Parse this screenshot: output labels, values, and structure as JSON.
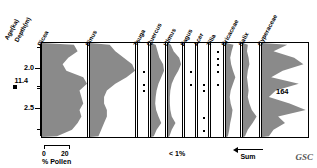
{
  "axis": {
    "title_age": "Age(ka)",
    "title_depth": "Depth(m)",
    "depth_ticks": [
      {
        "label": "2.0",
        "depth": 2.0
      },
      {
        "label": "2.5",
        "depth": 2.5
      }
    ],
    "minor_ticks": [
      1.75,
      2.25,
      2.75
    ],
    "age_markers": [
      {
        "label": "11.4",
        "depth": 2.22
      }
    ],
    "depth_range": [
      1.7,
      2.85
    ]
  },
  "legend": {
    "scale_min": "0",
    "scale_max": "20",
    "scale_caption": "% Pollen",
    "less_than_one": "< 1%",
    "sum_label": "Sum",
    "credit": "GSC",
    "count_label": "164"
  },
  "chart_data": {
    "type": "area",
    "xlabel": "% Pollen",
    "ylabel": "Depth(m)",
    "ylim": [
      1.7,
      2.85
    ],
    "xlim": [
      0,
      20
    ],
    "grid": false,
    "legend_position": "none",
    "depths": [
      1.72,
      1.8,
      1.88,
      1.96,
      2.04,
      2.12,
      2.2,
      2.28,
      2.36,
      2.44,
      2.52,
      2.6,
      2.68,
      2.76,
      2.84
    ],
    "series": [
      {
        "name": "Picea",
        "kind": "area",
        "width_px": 47,
        "max_pct": 24,
        "values": [
          17,
          19,
          14,
          11,
          13,
          22,
          24,
          20,
          21,
          22,
          20,
          21,
          19,
          16,
          8
        ]
      },
      {
        "name": "Pinus",
        "kind": "area",
        "width_px": 47,
        "max_pct": 16,
        "values": [
          7,
          9,
          12,
          15,
          16,
          13,
          9,
          6,
          5,
          5,
          6,
          6,
          5,
          4,
          3
        ]
      },
      {
        "name": "Tsuga",
        "kind": "dots",
        "width_px": 12,
        "max_pct": 1,
        "values": [
          0,
          0,
          0,
          0,
          0.4,
          0,
          0.4,
          0.4,
          0,
          0,
          0,
          0,
          0,
          0,
          0
        ]
      },
      {
        "name": "Quercus",
        "kind": "area",
        "width_px": 16,
        "max_pct": 3,
        "values": [
          1.0,
          1.4,
          1.8,
          2.6,
          2.8,
          2.2,
          1.6,
          1.2,
          1.0,
          0.9,
          1.1,
          1.6,
          2.2,
          1.2,
          0.6
        ]
      },
      {
        "name": "Ulmus",
        "kind": "area",
        "width_px": 16,
        "max_pct": 3,
        "values": [
          0.6,
          1.2,
          2.4,
          2.8,
          2.2,
          1.4,
          0.8,
          0.5,
          0.4,
          0.4,
          0.5,
          0.8,
          1.6,
          0.8,
          0.3
        ]
      },
      {
        "name": "Fagus",
        "kind": "dots",
        "width_px": 12,
        "max_pct": 1,
        "values": [
          0,
          0,
          0,
          0,
          0.4,
          0,
          0.4,
          0,
          0,
          0,
          0,
          0,
          0,
          0,
          0
        ]
      },
      {
        "name": "Acer",
        "kind": "dots",
        "width_px": 12,
        "max_pct": 1,
        "values": [
          0,
          0,
          0,
          0,
          0,
          0,
          0.4,
          0.4,
          0,
          0,
          0,
          0.4,
          0,
          0.4,
          0
        ]
      },
      {
        "name": "Tilia",
        "kind": "dots",
        "width_px": 14,
        "max_pct": 1,
        "values": [
          0,
          0.4,
          0.4,
          0.4,
          0.4,
          0,
          0.4,
          0,
          0,
          0,
          0,
          0,
          0,
          0,
          0
        ]
      },
      {
        "name": "Ericaceae",
        "kind": "area",
        "width_px": 16,
        "max_pct": 3,
        "values": [
          1.6,
          1.2,
          0.9,
          1.1,
          1.5,
          2.0,
          1.5,
          1.0,
          0.8,
          1.0,
          1.4,
          1.2,
          0.9,
          0.7,
          0.4
        ]
      },
      {
        "name": "Salix",
        "kind": "area",
        "width_px": 18,
        "max_pct": 4,
        "values": [
          1.2,
          1.0,
          1.4,
          1.6,
          1.2,
          1.0,
          1.2,
          1.4,
          1.2,
          1.6,
          2.2,
          3.4,
          2.4,
          1.2,
          0.5
        ]
      },
      {
        "name": "Cyperaceae",
        "kind": "area",
        "width_px": 48,
        "max_pct": 20,
        "values": [
          11,
          5,
          14,
          18,
          9,
          4,
          16,
          6,
          3,
          12,
          19,
          7,
          10,
          5,
          3
        ]
      }
    ]
  }
}
